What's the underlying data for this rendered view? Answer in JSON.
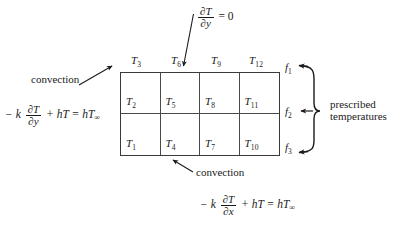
{
  "figure": {
    "background": "#ffffff",
    "ink": "#1a1a1a"
  },
  "mesh": {
    "rows": 2,
    "cols": 4,
    "cell_labels": [
      [
        "T",
        "2"
      ],
      [
        "T",
        "5"
      ],
      [
        "T",
        "8"
      ],
      [
        "T",
        "11"
      ],
      [
        "T",
        "1"
      ],
      [
        "T",
        "4"
      ],
      [
        "T",
        "7"
      ],
      [
        "T",
        "10"
      ]
    ],
    "cells": [
      {
        "symbol": "T",
        "index": "2"
      },
      {
        "symbol": "T",
        "index": "5"
      },
      {
        "symbol": "T",
        "index": "8"
      },
      {
        "symbol": "T",
        "index": "11"
      },
      {
        "symbol": "T",
        "index": "1"
      },
      {
        "symbol": "T",
        "index": "4"
      },
      {
        "symbol": "T",
        "index": "7"
      },
      {
        "symbol": "T",
        "index": "10"
      }
    ]
  },
  "top_labels": [
    {
      "symbol": "T",
      "index": "3"
    },
    {
      "symbol": "T",
      "index": "6"
    },
    {
      "symbol": "T",
      "index": "9"
    },
    {
      "symbol": "T",
      "index": "12"
    }
  ],
  "right_labels": [
    {
      "symbol": "f",
      "index": "1"
    },
    {
      "symbol": "f",
      "index": "2"
    },
    {
      "symbol": "f",
      "index": "3"
    }
  ],
  "annotations": {
    "top_bc": {
      "text": "∂T/∂y = 0",
      "numerator": "∂T",
      "denominator": "∂y",
      "rhs": "= 0"
    },
    "left_convection_label": "convection",
    "left_bc": {
      "lead": "− k",
      "numerator": "∂T",
      "denominator": "∂y",
      "tail": "+ hT = hT",
      "subscript": "∞"
    },
    "bottom_convection_label": "convection",
    "bottom_bc": {
      "lead": "− k",
      "numerator": "∂T",
      "denominator": "∂x",
      "tail": "+ hT = hT",
      "subscript": "∞"
    },
    "prescribed_line1": "prescribed",
    "prescribed_line2": "temperatures"
  }
}
